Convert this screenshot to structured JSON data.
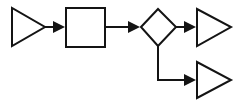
{
  "diagram": {
    "canvas": {
      "width": 243,
      "height": 105,
      "background": "#ffffff"
    },
    "stroke_color": "#141414",
    "stroke_width": 2,
    "fill_color": "#ffffff",
    "nodes": [
      {
        "id": "input-triangle",
        "name": "input-triangle",
        "shape": "triangle-right",
        "label": "",
        "points": "12,8 12,46 45,27"
      },
      {
        "id": "process-square",
        "name": "process-square",
        "shape": "rectangle",
        "label": "",
        "x": 66,
        "y": 8,
        "width": 39,
        "height": 39
      },
      {
        "id": "decision-diamond",
        "name": "decision-diamond",
        "shape": "diamond",
        "label": "",
        "points": "141,27 158,9 176,27 158,46"
      },
      {
        "id": "output-triangle-top",
        "name": "output-triangle-top",
        "shape": "triangle-right",
        "label": "",
        "points": "197,9 197,46 231,27"
      },
      {
        "id": "output-triangle-bottom",
        "name": "output-triangle-bottom",
        "shape": "triangle-right",
        "label": "",
        "points": "197,62 197,98 231,80"
      }
    ],
    "connectors": [
      {
        "id": "connector-input-to-square",
        "name": "connector-input-to-square",
        "label": "",
        "from": "input-triangle",
        "to": "process-square",
        "path": "M45,27 L61,27",
        "arrowhead": "53,21 65,27 53,33"
      },
      {
        "id": "connector-square-to-diamond",
        "name": "connector-square-to-diamond",
        "label": "",
        "from": "process-square",
        "to": "decision-diamond",
        "path": "M105,27 L136,27",
        "arrowhead": "128,21 140,27 128,33"
      },
      {
        "id": "connector-diamond-to-top-output",
        "name": "connector-diamond-to-top-output",
        "label": "",
        "from": "decision-diamond",
        "to": "output-triangle-top",
        "path": "M176,27 L192,27",
        "arrowhead": "184,21 196,27 184,33"
      },
      {
        "id": "connector-diamond-to-bottom-output",
        "name": "connector-diamond-to-bottom-output",
        "label": "",
        "from": "decision-diamond",
        "to": "output-triangle-bottom",
        "path": "M158,46 L158,80 L192,80",
        "arrowhead": "184,74 196,80 184,86"
      }
    ]
  }
}
